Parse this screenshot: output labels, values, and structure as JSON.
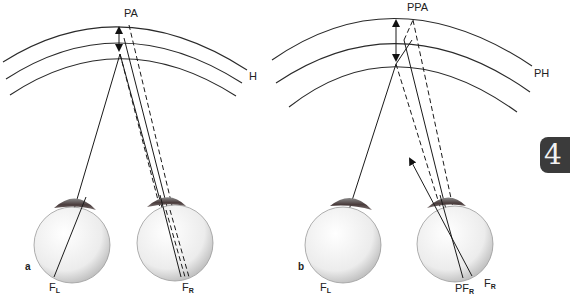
{
  "figure": {
    "panel_a": {
      "panel_label": "a",
      "point_label": "PA",
      "horopter_label": "H",
      "left_fovea_label": "F",
      "left_fovea_sub": "L",
      "right_fovea_label": "F",
      "right_fovea_sub": "R"
    },
    "panel_b": {
      "panel_label": "b",
      "point_label": "PPA",
      "horopter_label": "PH",
      "left_fovea_label": "F",
      "left_fovea_sub": "L",
      "pseudo_fovea_label": "PF",
      "pseudo_fovea_sub": "R",
      "right_fovea_label": "F",
      "right_fovea_sub": "R"
    },
    "chapter_tab": "4",
    "colors": {
      "line": "#1a1a1a",
      "eye_fill": "#eeeeee",
      "iris": "#5a4a4a",
      "tab": "#3b3b3b"
    }
  }
}
